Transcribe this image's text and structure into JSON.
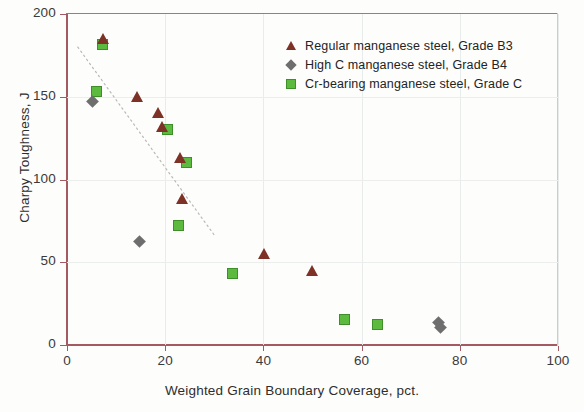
{
  "chart_data": {
    "type": "scatter",
    "title": "",
    "xlabel": "Weighted Grain Boundary Coverage, pct.",
    "ylabel": "Charpy Toughness, J",
    "xlim": [
      0,
      100
    ],
    "ylim": [
      0,
      200
    ],
    "xticks": [
      0,
      20,
      40,
      60,
      80,
      100
    ],
    "yticks": [
      0,
      50,
      100,
      150,
      200
    ],
    "grid": true,
    "legend_position": "top-right",
    "series": [
      {
        "name": "Regular manganese steel, Grade B3",
        "marker": "triangle",
        "color": "#7e3226",
        "points": [
          [
            7.3,
            185
          ],
          [
            14.3,
            150
          ],
          [
            18.5,
            140
          ],
          [
            19.4,
            132
          ],
          [
            23.1,
            113
          ],
          [
            23.5,
            88
          ],
          [
            40.1,
            55
          ],
          [
            49.9,
            45
          ]
        ]
      },
      {
        "name": "High C manganese steel, Grade B4",
        "marker": "diamond",
        "color": "#6e6e6e",
        "points": [
          [
            5.3,
            147
          ],
          [
            14.9,
            62
          ],
          [
            75.8,
            13
          ],
          [
            76.2,
            10
          ]
        ]
      },
      {
        "name": "Cr-bearing manganese steel, Grade C",
        "marker": "square",
        "color": "#5cbb3f",
        "points": [
          [
            6.1,
            153
          ],
          [
            7.3,
            181
          ],
          [
            20.5,
            130
          ],
          [
            24.5,
            110
          ],
          [
            22.8,
            72
          ],
          [
            33.8,
            43
          ],
          [
            56.6,
            15
          ],
          [
            63.3,
            12
          ]
        ]
      }
    ],
    "trendline": {
      "style": "dotted",
      "color": "#b9b9b9",
      "x_start": 2.2,
      "y_start": 180,
      "x_end": 30.1,
      "y_end": 66
    }
  },
  "legend": {
    "entries": [
      {
        "label": "Regular manganese steel, Grade B3",
        "marker": "triangle-marker"
      },
      {
        "label": "High C manganese steel, Grade B4",
        "marker": "diamond-marker"
      },
      {
        "label": "Cr-bearing manganese steel, Grade C",
        "marker": "square-marker"
      }
    ]
  },
  "colors": {
    "axis": "#a35a63",
    "grid": "#e8eceb",
    "series_b3": "#7e3226",
    "series_b4": "#6e6e6e",
    "series_c": "#5cbb3f",
    "trend": "#b9b9b9"
  }
}
